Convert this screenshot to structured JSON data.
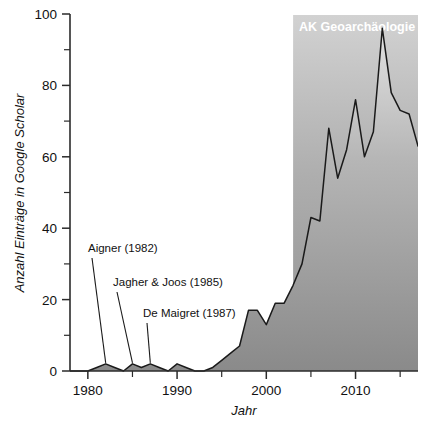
{
  "chart_data": {
    "type": "area",
    "title": "",
    "xlabel": "Jahr",
    "ylabel": "Anzahl Einträge in Google Scholar",
    "xlim": [
      1978,
      2017
    ],
    "ylim": [
      0,
      100
    ],
    "xticks": [
      1980,
      1990,
      2000,
      2010
    ],
    "xtick_labels": [
      "1980",
      "1990",
      "2000",
      "2010"
    ],
    "yticks": [
      0,
      20,
      40,
      60,
      80,
      100
    ],
    "ytick_labels": [
      "0",
      "20",
      "40",
      "60",
      "80",
      "100"
    ],
    "yticks_minor": [
      10,
      30,
      50,
      70,
      90
    ],
    "grid": false,
    "legend_position": "top-right",
    "series": [
      {
        "name": "Anzahl Einträge in Google Scholar",
        "x": [
          1978,
          1979,
          1980,
          1981,
          1982,
          1983,
          1984,
          1985,
          1986,
          1987,
          1988,
          1989,
          1990,
          1991,
          1992,
          1993,
          1994,
          1995,
          1996,
          1997,
          1998,
          1999,
          2000,
          2001,
          2002,
          2003,
          2004,
          2005,
          2006,
          2007,
          2008,
          2009,
          2010,
          2011,
          2012,
          2013,
          2014,
          2015,
          2016,
          2017
        ],
        "values": [
          0,
          0,
          0,
          1,
          2,
          1,
          0,
          2,
          1,
          2,
          1,
          0,
          2,
          1,
          0,
          0,
          1,
          3,
          5,
          7,
          17,
          17,
          13,
          19,
          19,
          24,
          30,
          43,
          42,
          68,
          54,
          62,
          76,
          60,
          67,
          96,
          78,
          73,
          72,
          63
        ]
      }
    ],
    "annotations": [
      {
        "text": "Aigner (1982)",
        "year": 1982,
        "value": 2
      },
      {
        "text": "Jagher & Joos (1985)",
        "year": 1985,
        "value": 2
      },
      {
        "text": "De Maigret (1987)",
        "year": 1987,
        "value": 2
      }
    ],
    "legend": {
      "label": "AK Geoarchäologie",
      "start_year": 2003,
      "end_year": 2017
    },
    "colors": {
      "area_fill_top": "#d9d9d9",
      "area_fill_bottom": "#8c8c8c",
      "line": "#1a1a1a",
      "axis": "#2b2b2b",
      "legend_band_top": "#d0d0d0",
      "legend_band_bottom": "#8f8f8f",
      "legend_text": "#ffffff",
      "background": "#ffffff"
    }
  }
}
